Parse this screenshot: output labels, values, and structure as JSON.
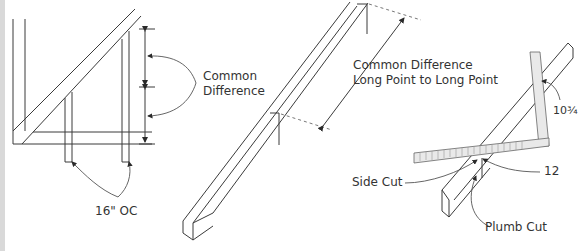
{
  "figure": {
    "panels": [
      {
        "id": "rafter-layout",
        "labels": {
          "common_difference_line1": "Common",
          "common_difference_line2": "Difference",
          "spacing": "16\" OC"
        }
      },
      {
        "id": "jack-rafter",
        "labels": {
          "line1": "Common Difference",
          "line2": "Long Point to Long Point"
        }
      },
      {
        "id": "framing-square",
        "labels": {
          "tongue_value": "10¾",
          "blade_value": "12",
          "side_cut": "Side Cut",
          "plumb_cut": "Plumb Cut"
        }
      }
    ],
    "colors": {
      "line": "#3a3a3a",
      "edge_strip": "#d9d9d9",
      "square_fill": "#e9e9e9"
    }
  }
}
